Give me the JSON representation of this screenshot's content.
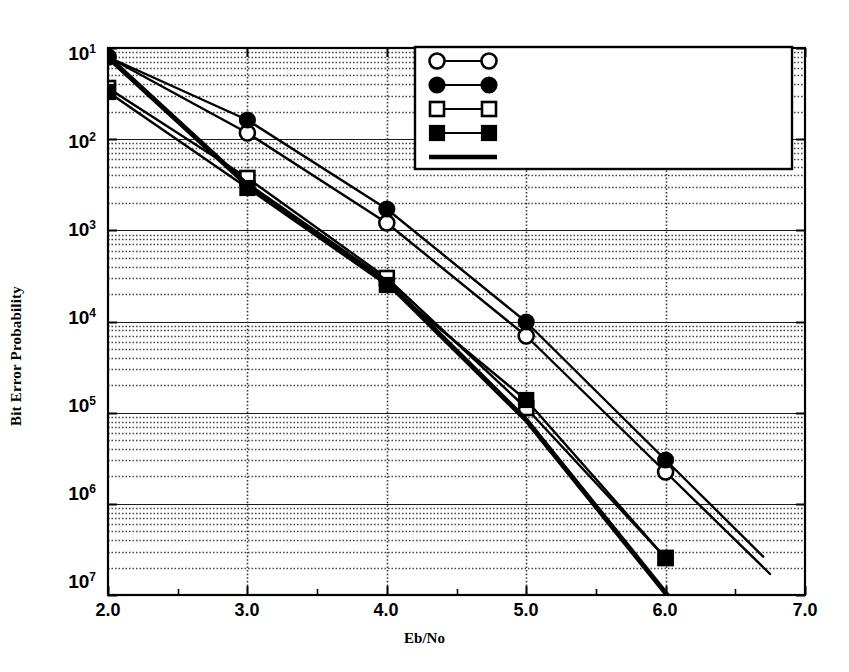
{
  "chart_data": {
    "type": "line",
    "title": "",
    "xlabel": "Eb/No",
    "ylabel": "Bit Error Probability",
    "xlim": [
      2.0,
      7.0
    ],
    "ylim_exponent": [
      -7,
      -1
    ],
    "yscale": "log",
    "grid": "dotted minor log gridlines horizontal, dotted vertical gridlines at integers",
    "legend_position": "top-center-right",
    "xticks": [
      "2.0",
      "3.0",
      "4.0",
      "5.0",
      "6.0",
      "7.0"
    ],
    "yticks": [
      "10 1",
      "10 2",
      "10 3",
      "10 4",
      "10 5",
      "10 6",
      "10 7"
    ],
    "ytick_bases": [
      "10",
      "10",
      "10",
      "10",
      "10",
      "10",
      "10"
    ],
    "ytick_exponents": [
      "1",
      "2",
      "3",
      "4",
      "5",
      "6",
      "7"
    ],
    "x": [
      2.0,
      3.0,
      4.0,
      5.0,
      6.0
    ],
    "series": [
      {
        "name": "(15,11) - Viterbi",
        "marker": "open-circle",
        "values": [
          0.075,
          0.058,
          0.0012,
          7.5e-05,
          2.4e-06
        ],
        "y_pixels": [
          57,
          133,
          223,
          336,
          472
        ],
        "extend_to_x": 6.75
      },
      {
        "name": "(15,11) - Sequential",
        "marker": "filled-circle",
        "values": [
          0.075,
          0.07,
          0.0015,
          9e-05,
          2.8e-06
        ],
        "y_pixels": [
          57,
          120,
          209,
          322,
          460
        ],
        "extend_to_x": 6.7
      },
      {
        "name": "subcode of (15,11) - Viterbi",
        "marker": "open-square",
        "values": [
          0.32,
          0.0028,
          0.00023,
          6.5e-05,
          2e-07
        ],
        "y_pixels": [
          88,
          178,
          278,
          408,
          558
        ],
        "extend_to_x": 6.0
      },
      {
        "name": "subcode of (15,11) - Sequential",
        "marker": "filled-square",
        "values": [
          0.32,
          0.0031,
          0.00026,
          0.0001,
          2e-07
        ],
        "y_pixels": [
          92,
          188,
          285,
          400,
          558
        ],
        "extend_to_x": 6.0
      },
      {
        "name": "R=1/2, K=7 convolutional - Viterbi",
        "marker": "line-only",
        "values": [
          0.075,
          0.003,
          0.00026,
          9e-06,
          1e-07
        ],
        "y_pixels": [
          57,
          185,
          282,
          420,
          593
        ],
        "extend_to_x": 6.05
      }
    ]
  },
  "axes": {
    "x_title": "Eb/No",
    "y_title": "Bit Error Probability"
  },
  "legend": {
    "items": [
      {
        "label": "(15,11) - Viterbi",
        "marker": "open-circle"
      },
      {
        "label": "(15,11) - Sequential",
        "marker": "filled-circle"
      },
      {
        "label": "subcode of (15,11) - Viterbi",
        "marker": "open-square"
      },
      {
        "label": "subcode of (15,11) - Sequential",
        "marker": "filled-square"
      },
      {
        "label": "R=1/2, K=7 convolutional - Viterbi",
        "marker": "line-only"
      }
    ]
  },
  "colors": {
    "ink": "#000000",
    "background": "#ffffff",
    "grid": "#555555"
  }
}
